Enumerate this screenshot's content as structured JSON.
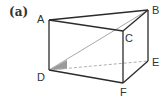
{
  "caption": "(a)",
  "figure": {
    "type": "triangular-prism",
    "vertices": {
      "A": {
        "label": "A",
        "x": 49,
        "y": 20
      },
      "B": {
        "label": "B",
        "x": 148,
        "y": 10
      },
      "C": {
        "label": "C",
        "x": 123,
        "y": 31
      },
      "D": {
        "label": "D",
        "x": 49,
        "y": 70
      },
      "E": {
        "label": "E",
        "x": 148,
        "y": 61
      },
      "F": {
        "label": "F",
        "x": 123,
        "y": 83
      }
    },
    "solid_edges": [
      "AB",
      "AC",
      "BC",
      "AD",
      "CF",
      "BE",
      "DF",
      "FE"
    ],
    "hidden_edges": [
      "DE"
    ],
    "diagonals": [
      "DB"
    ],
    "shaded_angle": {
      "vertex": "D",
      "between": [
        "DB",
        "DE"
      ]
    },
    "colors": {
      "edge": "#2b2b2b",
      "hidden_edge": "#b0b0b0",
      "diagonal": "#a8a8a8",
      "shade": "#9a9a9a"
    }
  }
}
